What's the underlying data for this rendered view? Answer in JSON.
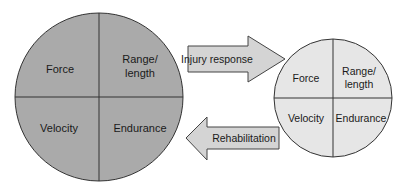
{
  "diagram": {
    "large_circle": {
      "quadrants": {
        "top_left": [
          "Force"
        ],
        "top_right": [
          "Range/",
          "length"
        ],
        "bottom_left": [
          "Velocity"
        ],
        "bottom_right": [
          "Endurance"
        ]
      },
      "fill": "#aaaaaa"
    },
    "small_circle": {
      "quadrants": {
        "top_left": [
          "Force"
        ],
        "top_right": [
          "Range/",
          "length"
        ],
        "bottom_left": [
          "Velocity"
        ],
        "bottom_right": [
          "Endurance"
        ]
      },
      "fill": "#e6e6e6"
    },
    "arrows": {
      "forward": {
        "label": "Injury response",
        "direction": "right"
      },
      "backward": {
        "label": "Rehabilitation",
        "direction": "left"
      }
    },
    "colors": {
      "arrow_fill": "#d4d4d4",
      "stroke": "#333333"
    }
  }
}
